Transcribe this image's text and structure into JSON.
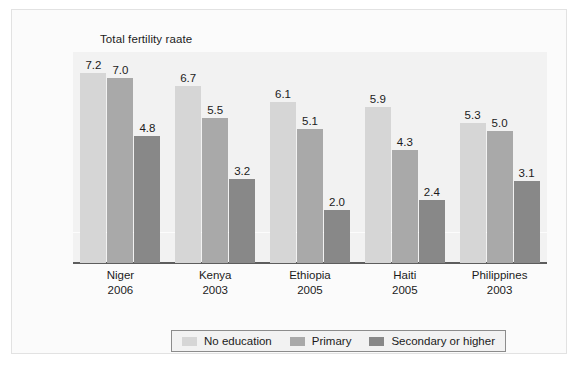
{
  "chart_data": {
    "type": "bar",
    "title": "Total fertility raate",
    "xlabel": "",
    "ylabel": "Total fertility raate",
    "ylim": [
      0,
      8
    ],
    "grid": true,
    "legend_position": "bottom",
    "categories": [
      "Niger",
      "Kenya",
      "Ethiopia",
      "Haiti",
      "Philippines"
    ],
    "category_years": [
      "2006",
      "2003",
      "2005",
      "2005",
      "2003"
    ],
    "series": [
      {
        "name": "No education",
        "color": "#d6d6d6",
        "values": [
          7.2,
          6.7,
          6.1,
          5.9,
          5.3
        ]
      },
      {
        "name": "Primary",
        "color": "#a9a9a9",
        "values": [
          7.0,
          5.5,
          5.1,
          4.3,
          5.0
        ]
      },
      {
        "name": "Secondary or higher",
        "color": "#888888",
        "values": [
          4.8,
          3.2,
          2.0,
          2.4,
          3.1
        ]
      }
    ]
  },
  "legend": {
    "items": [
      {
        "label": "No education",
        "color": "#d6d6d6"
      },
      {
        "label": "Primary",
        "color": "#a9a9a9"
      },
      {
        "label": "Secondary or higher",
        "color": "#888888"
      }
    ]
  },
  "axis": {
    "labels": [
      {
        "name": "Niger",
        "year": "2006"
      },
      {
        "name": "Kenya",
        "year": "2003"
      },
      {
        "name": "Ethiopia",
        "year": "2005"
      },
      {
        "name": "Haiti",
        "year": "2005"
      },
      {
        "name": "Philippines",
        "year": "2003"
      }
    ]
  }
}
